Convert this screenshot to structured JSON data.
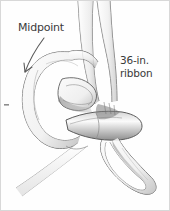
{
  "figure": {
    "background_color": "#fefefe",
    "border_color": "#d8d8d8",
    "ink_color": "#3a3a3a",
    "line_color": "#555555",
    "shade_color": "#9a9a9a"
  },
  "annotations": {
    "midpoint": {
      "label": "Midpoint",
      "pointer": "curved-arrow",
      "points_to": "left ribbon loop"
    },
    "ribbon": {
      "line1": "36-in.",
      "line2": "ribbon",
      "full": "36-in. ribbon"
    }
  },
  "parts": [
    {
      "name": "upper-left-strand",
      "description": "ribbon strand rising to top edge"
    },
    {
      "name": "upper-right-strand",
      "description": "second ribbon strand rising to top edge"
    },
    {
      "name": "left-loop",
      "description": "large open loop on the left side"
    },
    {
      "name": "inner-fold",
      "description": "folded ribbon tip inside the left loop"
    },
    {
      "name": "knot-wrap",
      "description": "horizontal band wrapping the knot center"
    },
    {
      "name": "right-loop",
      "description": "hanging loop at lower right"
    },
    {
      "name": "lower-tail",
      "description": "ribbon tail running off the lower-left edge"
    },
    {
      "name": "edge-tick",
      "description": "small tick mark at left edge"
    }
  ]
}
